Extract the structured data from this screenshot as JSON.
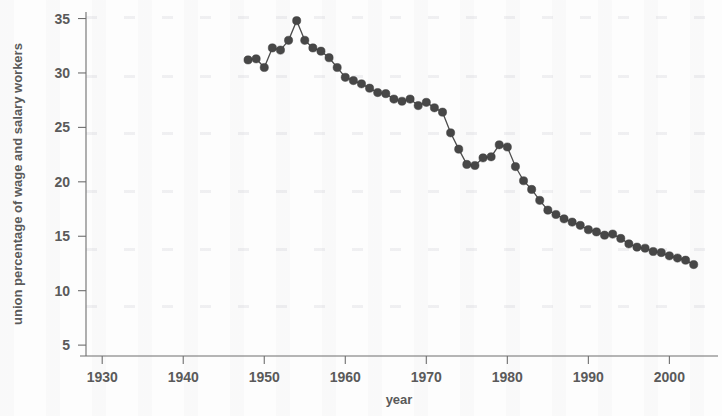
{
  "chart_data": {
    "type": "line",
    "title": "",
    "xlabel": "year",
    "ylabel": "union percentage of wage and salary workers",
    "xlim": [
      1928,
      2006
    ],
    "ylim": [
      4,
      35.6
    ],
    "xticks": [
      1930,
      1940,
      1950,
      1960,
      1970,
      1980,
      1990,
      2000
    ],
    "yticks": [
      5,
      10,
      15,
      20,
      25,
      30,
      35
    ],
    "grid": false,
    "legend": null,
    "marker": "filled-circle",
    "marker_color": "#474747",
    "line_color": "#4d4d4d",
    "x": [
      1948,
      1949,
      1950,
      1951,
      1952,
      1953,
      1954,
      1955,
      1956,
      1957,
      1958,
      1959,
      1960,
      1961,
      1962,
      1963,
      1964,
      1965,
      1966,
      1967,
      1968,
      1969,
      1970,
      1971,
      1972,
      1973,
      1974,
      1975,
      1976,
      1977,
      1978,
      1979,
      1980,
      1981,
      1982,
      1983,
      1984,
      1985,
      1986,
      1987,
      1988,
      1989,
      1990,
      1991,
      1992,
      1993,
      1994,
      1995,
      1996,
      1997,
      1998,
      1999,
      2000,
      2001,
      2002,
      2003
    ],
    "y": [
      31.2,
      31.3,
      30.5,
      32.3,
      32.1,
      33.0,
      34.8,
      33.0,
      32.3,
      32.0,
      31.4,
      30.5,
      29.6,
      29.3,
      29.0,
      28.6,
      28.2,
      28.1,
      27.6,
      27.4,
      27.6,
      27.0,
      27.3,
      26.8,
      26.4,
      24.5,
      23.0,
      21.6,
      21.5,
      22.2,
      22.3,
      23.4,
      23.2,
      21.4,
      20.1,
      19.3,
      18.3,
      17.4,
      17.0,
      16.6,
      16.3,
      16.0,
      15.6,
      15.4,
      15.1,
      15.2,
      14.8,
      14.3,
      14.0,
      13.9,
      13.6,
      13.5,
      13.2,
      13.0,
      12.8,
      12.4
    ]
  },
  "axes": {
    "x_tick_labels": [
      "1930",
      "1940",
      "1950",
      "1960",
      "1970",
      "1980",
      "1990",
      "2000"
    ],
    "y_tick_labels": [
      "5",
      "10",
      "15",
      "20",
      "25",
      "30",
      "35"
    ],
    "x_axis_title": "year",
    "y_axis_title": "union percentage of wage and salary workers"
  },
  "colors": {
    "marker": "#474747",
    "line": "#4d4d4d",
    "axis": "#6e6e6e",
    "text": "#5a5a5a",
    "background": "#fdfdfd"
  }
}
